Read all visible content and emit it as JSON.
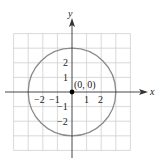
{
  "diagram": {
    "type": "coordinate-plane-circle",
    "center_label": "(0, 0)",
    "x_axis_label": "x",
    "y_axis_label": "y",
    "x_ticks": [
      {
        "value": -2,
        "label": "−2"
      },
      {
        "value": -1,
        "label": "−1"
      },
      {
        "value": 1,
        "label": "1"
      },
      {
        "value": 2,
        "label": "2"
      }
    ],
    "y_ticks": [
      {
        "value": 2,
        "label": "2"
      },
      {
        "value": 1,
        "label": "1"
      },
      {
        "value": -1,
        "label": "−1"
      },
      {
        "value": -2,
        "label": "−2"
      }
    ],
    "circle": {
      "center": [
        0,
        0
      ],
      "radius": 3
    },
    "grid_range": {
      "x": [
        -4,
        4
      ],
      "y": [
        -4,
        4
      ]
    },
    "colors": {
      "grid": "#cfcfcf",
      "circle": "#8a8a8a",
      "axes": "#333333",
      "point": "#000000"
    }
  }
}
